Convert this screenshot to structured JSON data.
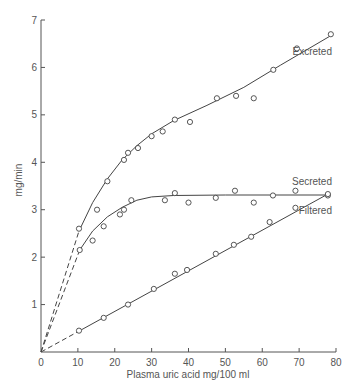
{
  "chart_data": {
    "type": "scatter",
    "title": "",
    "xlabel": "Plasma uric acid mg/100 ml",
    "ylabel": "mg/min",
    "xlim": [
      0,
      80
    ],
    "ylim": [
      0,
      7
    ],
    "x_ticks": [
      0,
      10,
      20,
      30,
      40,
      50,
      60,
      70,
      80
    ],
    "y_ticks": [
      1,
      2,
      3,
      4,
      5,
      6,
      7
    ],
    "grid": false,
    "legend": "inline labels at line ends",
    "series": [
      {
        "name": "Excreted",
        "marker": "open circle",
        "points": [
          [
            10.3,
            2.6
          ],
          [
            15.2,
            3.0
          ],
          [
            18,
            3.6
          ],
          [
            22.5,
            4.05
          ],
          [
            23.6,
            4.2
          ],
          [
            26.3,
            4.3
          ],
          [
            30,
            4.55
          ],
          [
            33,
            4.65
          ],
          [
            36.3,
            4.9
          ],
          [
            40.4,
            4.85
          ],
          [
            47.7,
            5.35
          ],
          [
            52.9,
            5.4
          ],
          [
            57.7,
            5.35
          ],
          [
            63,
            5.95
          ],
          [
            69.4,
            6.4
          ],
          [
            78.6,
            6.7
          ]
        ],
        "fit_curve": [
          [
            10.3,
            2.55
          ],
          [
            14,
            3.15
          ],
          [
            18,
            3.65
          ],
          [
            22,
            4.05
          ],
          [
            26,
            4.35
          ],
          [
            30,
            4.6
          ],
          [
            36,
            4.88
          ],
          [
            45,
            5.2
          ],
          [
            55,
            5.58
          ],
          [
            65,
            6.05
          ],
          [
            78.6,
            6.67
          ]
        ],
        "dashed_extrapolation": [
          [
            0,
            0
          ],
          [
            10.3,
            2.55
          ]
        ]
      },
      {
        "name": "Secreted",
        "marker": "open circle",
        "points": [
          [
            10.5,
            2.15
          ],
          [
            14,
            2.35
          ],
          [
            17,
            2.65
          ],
          [
            21.4,
            2.9
          ],
          [
            22.5,
            3.0
          ],
          [
            24.5,
            3.2
          ],
          [
            33.6,
            3.2
          ],
          [
            36.3,
            3.35
          ],
          [
            40,
            3.15
          ],
          [
            47.4,
            3.25
          ],
          [
            52.6,
            3.4
          ],
          [
            57.7,
            3.15
          ],
          [
            62.9,
            3.3
          ],
          [
            69,
            3.4
          ],
          [
            77.8,
            3.3
          ]
        ],
        "fit_curve": [
          [
            10.5,
            2.15
          ],
          [
            14,
            2.55
          ],
          [
            18,
            2.85
          ],
          [
            22,
            3.05
          ],
          [
            26,
            3.2
          ],
          [
            30,
            3.27
          ],
          [
            36,
            3.3
          ],
          [
            50,
            3.31
          ],
          [
            77.8,
            3.31
          ]
        ],
        "dashed_extrapolation": [
          [
            0,
            0
          ],
          [
            10.5,
            2.15
          ]
        ]
      },
      {
        "name": "Filtered",
        "marker": "open circle",
        "points": [
          [
            10.3,
            0.45
          ],
          [
            17,
            0.72
          ],
          [
            23.6,
            1.0
          ],
          [
            30.6,
            1.33
          ],
          [
            36.3,
            1.65
          ],
          [
            39.6,
            1.73
          ],
          [
            47.4,
            2.07
          ],
          [
            52.3,
            2.26
          ],
          [
            57,
            2.43
          ],
          [
            62,
            2.74
          ],
          [
            69,
            3.04
          ],
          [
            77.8,
            3.33
          ]
        ],
        "fit_curve": [
          [
            10.3,
            0.44
          ],
          [
            77.8,
            3.33
          ]
        ],
        "dashed_extrapolation": [
          [
            0,
            0
          ],
          [
            10.3,
            0.44
          ]
        ]
      }
    ]
  }
}
